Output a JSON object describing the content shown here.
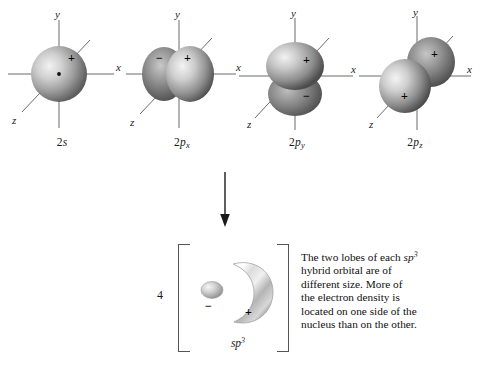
{
  "diagram": {
    "axis_labels": {
      "x": "x",
      "y": "y",
      "z": "z"
    },
    "signs": {
      "positive": "+",
      "negative": "−"
    },
    "colors": {
      "orbital_light": "#e8e8e8",
      "orbital_mid": "#9a9a9a",
      "orbital_dark": "#4f4f4f",
      "axis": "#6b6b6b",
      "bracket": "#555555",
      "text": "#111111",
      "background": "#ffffff"
    },
    "arrow": {
      "direction": "down"
    },
    "coefficient": "4"
  },
  "orbitals": [
    {
      "id": "orbital-2s",
      "prefix": "2",
      "letter": "s",
      "subscript": "",
      "label": "2s",
      "shape": "sphere",
      "lobes": [
        {
          "sign": "+"
        }
      ]
    },
    {
      "id": "orbital-2px",
      "prefix": "2",
      "letter": "p",
      "subscript": "x",
      "label": "2px",
      "shape": "dumbbell-x",
      "lobes": [
        {
          "sign": "−"
        },
        {
          "sign": "+"
        }
      ]
    },
    {
      "id": "orbital-2py",
      "prefix": "2",
      "letter": "p",
      "subscript": "y",
      "label": "2py",
      "shape": "dumbbell-y",
      "lobes": [
        {
          "sign": "+"
        },
        {
          "sign": "−"
        }
      ]
    },
    {
      "id": "orbital-2pz",
      "prefix": "2",
      "letter": "p",
      "subscript": "z",
      "label": "2pz",
      "shape": "dumbbell-z",
      "lobes": [
        {
          "sign": "+"
        },
        {
          "sign": "+"
        }
      ]
    }
  ],
  "hybrid": {
    "id": "hybrid-sp3",
    "letters": "sp",
    "superscript": "3",
    "label": "sp3",
    "count": "4",
    "lobes": [
      {
        "sign": "−",
        "size": "small"
      },
      {
        "sign": "+",
        "size": "large"
      }
    ]
  },
  "caption": {
    "line1": "The two lobes of each ",
    "term": "sp",
    "term_sup": "3",
    "line2": "hybrid orbital are of",
    "line3": "different size. More of",
    "line4": "the electron density is",
    "line5": "located on one side of the",
    "line6": "nucleus than on the other."
  }
}
